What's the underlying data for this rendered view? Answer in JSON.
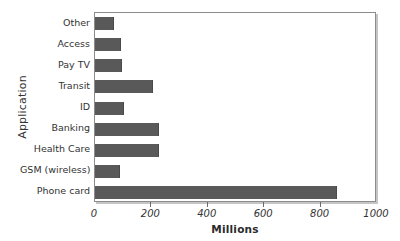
{
  "chart_data": {
    "type": "bar",
    "orientation": "horizontal",
    "title": "",
    "xlabel": "Millions",
    "ylabel": "Application",
    "categories": [
      "Other",
      "Access",
      "Pay TV",
      "Transit",
      "ID",
      "Banking",
      "Health Care",
      "GSM (wireless)",
      "Phone card"
    ],
    "values": [
      68,
      93,
      95,
      206,
      103,
      228,
      228,
      89,
      858
    ],
    "xlim": [
      0,
      1000
    ],
    "xticks": [
      0,
      200,
      400,
      600,
      800,
      1000
    ],
    "xtick_labels": [
      "0",
      "200",
      "400",
      "600",
      "800",
      "1000"
    ],
    "grid": false,
    "legend": null,
    "bar_color": "#595959",
    "frame_color": "#8c8c8c"
  },
  "axes": {
    "y_title": "Application",
    "x_title": "Millions"
  }
}
